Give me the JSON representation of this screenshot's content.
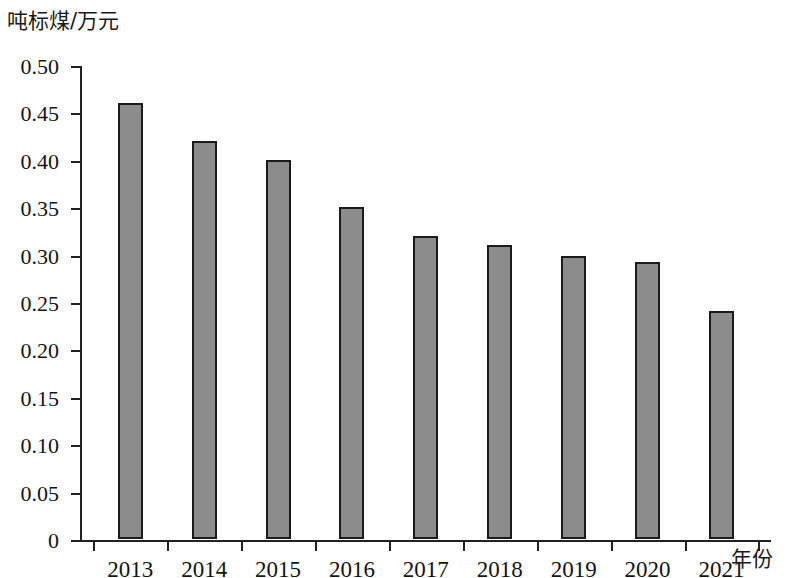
{
  "chart_data": {
    "type": "bar",
    "title": "",
    "subtitle": "",
    "ylabel": "吨标煤/万元",
    "xlabel": "年份",
    "categories": [
      "2013",
      "2014",
      "2015",
      "2016",
      "2017",
      "2018",
      "2019",
      "2020",
      "2021"
    ],
    "values": [
      0.46,
      0.42,
      0.4,
      0.35,
      0.32,
      0.31,
      0.299,
      0.292,
      0.24
    ],
    "ylim": [
      0,
      0.5
    ],
    "xlim_categories": 9,
    "ytick_labels": [
      "0",
      "0.05",
      "0.10",
      "0.15",
      "0.20",
      "0.25",
      "0.30",
      "0.35",
      "0.40",
      "0.45",
      "0.50"
    ],
    "ytick_values": [
      0,
      0.05,
      0.1,
      0.15,
      0.2,
      0.25,
      0.3,
      0.35,
      0.4,
      0.45,
      0.5
    ],
    "grid": false,
    "legend": null,
    "legend_position": "none",
    "series": [
      {
        "name": "单位产值综合能耗",
        "values": [
          0.46,
          0.42,
          0.4,
          0.35,
          0.32,
          0.31,
          0.299,
          0.292,
          0.24
        ]
      }
    ],
    "bar_fill_color": "#8c8c8c",
    "bar_edge_color": "#1b1b1b",
    "axis_color": "#222222"
  }
}
